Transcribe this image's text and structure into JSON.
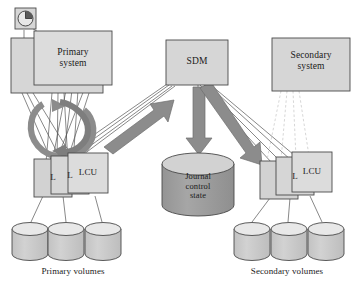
{
  "diagram": {
    "colors": {
      "box_fill": "#d6d6d6",
      "box_stroke": "#4a4a4a",
      "cylinder_fill": "#cfcfcf",
      "cylinder_top": "#e6e6e6",
      "journal_fill": "#9e9e9e",
      "journal_top": "#d4d4d4",
      "arrow_fill": "#8c8c8c",
      "arrow_stroke": "#6b6b6b",
      "line_stroke": "#555555",
      "dashed_stroke": "#c8c8c8",
      "text": "#1a1a1a",
      "background": "#ffffff"
    },
    "nodes": {
      "clock": {
        "name": "clock-icon",
        "label": ""
      },
      "primary_system": {
        "label_line1": "Primary",
        "label_line2": "system",
        "stacked": true
      },
      "sdm": {
        "label": "SDM"
      },
      "secondary_system": {
        "label_line1": "Secondary",
        "label_line2": "system"
      },
      "journal": {
        "label_line1": "Journal",
        "label_line2": "control",
        "label_line3": "state"
      }
    },
    "primary_lcus": [
      {
        "label": "L"
      },
      {
        "label": "L"
      },
      {
        "label": "LCU"
      }
    ],
    "secondary_lcus": [
      {
        "label": ""
      },
      {
        "label": "L"
      },
      {
        "label": "LCU"
      }
    ],
    "primary_volumes": {
      "count": 3,
      "caption": "Primary volumes"
    },
    "secondary_volumes": {
      "count": 3,
      "caption": "Secondary volumes"
    },
    "arrows": [
      {
        "name": "lcu-to-sdm-arrow",
        "from": "primary-lcu",
        "to": "sdm",
        "style": "thick-gray"
      },
      {
        "name": "sdm-to-journal-arrow",
        "from": "sdm",
        "to": "journal",
        "style": "thick-gray"
      },
      {
        "name": "sdm-to-secondary-lcu-arrow",
        "from": "sdm",
        "to": "secondary-lcu",
        "style": "thick-gray"
      },
      {
        "name": "primary-loop-arrow",
        "from": "primary-system",
        "to": "primary-system",
        "style": "circular-loop"
      }
    ]
  }
}
